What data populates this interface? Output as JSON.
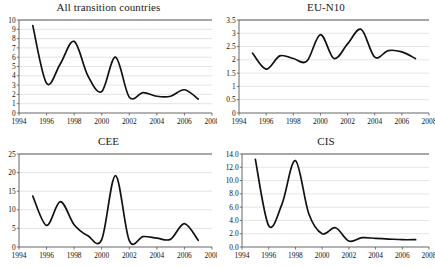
{
  "figure": {
    "background": "#ffffff",
    "line_color": "#111111",
    "grid_color": "#d8d8d8",
    "axis_color": "#555555",
    "top_rule_color": "#8a8a8a",
    "panel_count": 4
  },
  "chart_data": [
    {
      "type": "line",
      "title": "All transition countries",
      "xlabel": "",
      "ylabel": "",
      "grid": true,
      "legend": "none",
      "xlim": [
        1994,
        2008
      ],
      "ylim": [
        0,
        10
      ],
      "xticks": [
        1994,
        1996,
        1998,
        2000,
        2002,
        2004,
        2006,
        2008
      ],
      "xticklabels": [
        "1994",
        "1996",
        "1998",
        "2000",
        "2002",
        "2004",
        "2006",
        "2008"
      ],
      "yticks": [
        0,
        1,
        2,
        3,
        4,
        5,
        6,
        7,
        8,
        9,
        10
      ],
      "yticklabels": [
        "0",
        "1",
        "2",
        "3",
        "4",
        "5",
        "6",
        "7",
        "8",
        "9",
        "10"
      ],
      "x": [
        1995,
        1996,
        1997,
        1998,
        1999,
        2000,
        2001,
        2002,
        2003,
        2004,
        2005,
        2006,
        2007
      ],
      "values": [
        9.4,
        3.2,
        5.3,
        7.7,
        4.0,
        2.3,
        6.0,
        1.7,
        2.2,
        1.8,
        1.8,
        2.5,
        1.5
      ]
    },
    {
      "type": "line",
      "title": "EU-N10",
      "xlabel": "",
      "ylabel": "",
      "grid": true,
      "legend": "none",
      "xlim": [
        1994,
        2008
      ],
      "ylim": [
        0,
        3.5
      ],
      "xticks": [
        1994,
        1996,
        1998,
        2000,
        2002,
        2004,
        2006,
        2008
      ],
      "xticklabels": [
        "1994",
        "1996",
        "1998",
        "2000",
        "2002",
        "2004",
        "2006",
        "2008"
      ],
      "yticks": [
        0,
        0.5,
        1,
        1.5,
        2,
        2.5,
        3,
        3.5
      ],
      "yticklabels": [
        "0",
        "0.5",
        "1",
        "1.5",
        "2",
        "2.5",
        "3",
        "3.5"
      ],
      "x": [
        1995,
        1996,
        1997,
        1998,
        1999,
        2000,
        2001,
        2002,
        2003,
        2004,
        2005,
        2006,
        2007
      ],
      "values": [
        2.25,
        1.65,
        2.15,
        2.05,
        1.95,
        2.95,
        2.05,
        2.6,
        3.15,
        2.1,
        2.35,
        2.3,
        2.05
      ]
    },
    {
      "type": "line",
      "title": "CEE",
      "xlabel": "",
      "ylabel": "",
      "grid": true,
      "legend": "none",
      "xlim": [
        1994,
        2008
      ],
      "ylim": [
        0,
        25
      ],
      "xticks": [
        1994,
        1996,
        1998,
        2000,
        2002,
        2004,
        2006,
        2008
      ],
      "xticklabels": [
        "1994",
        "1996",
        "1998",
        "2000",
        "2002",
        "2004",
        "2006",
        "2008"
      ],
      "yticks": [
        0,
        5,
        10,
        15,
        20,
        25
      ],
      "yticklabels": [
        "0",
        "5",
        "10",
        "15",
        "20",
        "25"
      ],
      "x": [
        1995,
        1996,
        1997,
        1998,
        1999,
        2000,
        2001,
        2002,
        2003,
        2004,
        2005,
        2006,
        2007
      ],
      "values": [
        13.7,
        5.8,
        12.2,
        6.0,
        3.0,
        2.0,
        19.2,
        1.7,
        2.8,
        2.4,
        2.1,
        6.3,
        1.8
      ]
    },
    {
      "type": "line",
      "title": "CIS",
      "xlabel": "",
      "ylabel": "",
      "grid": true,
      "legend": "none",
      "xlim": [
        1994,
        2008
      ],
      "ylim": [
        0,
        14
      ],
      "xticks": [
        1994,
        1996,
        1998,
        2000,
        2002,
        2004,
        2006,
        2008
      ],
      "xticklabels": [
        "1994",
        "1996",
        "1998",
        "2000",
        "2002",
        "2004",
        "2006",
        "2008"
      ],
      "yticks": [
        0,
        2,
        4,
        6,
        8,
        10,
        12,
        14
      ],
      "yticklabels": [
        "0.0",
        "2.0",
        "4.0",
        "6.0",
        "8.0",
        "10.0",
        "12.0",
        "14.0"
      ],
      "x": [
        1995,
        1996,
        1997,
        1998,
        1999,
        2000,
        2001,
        2002,
        2003,
        2004,
        2005,
        2006,
        2007
      ],
      "values": [
        13.2,
        3.2,
        6.5,
        13.0,
        5.0,
        2.0,
        2.9,
        0.9,
        1.4,
        1.3,
        1.2,
        1.1,
        1.1
      ]
    }
  ]
}
